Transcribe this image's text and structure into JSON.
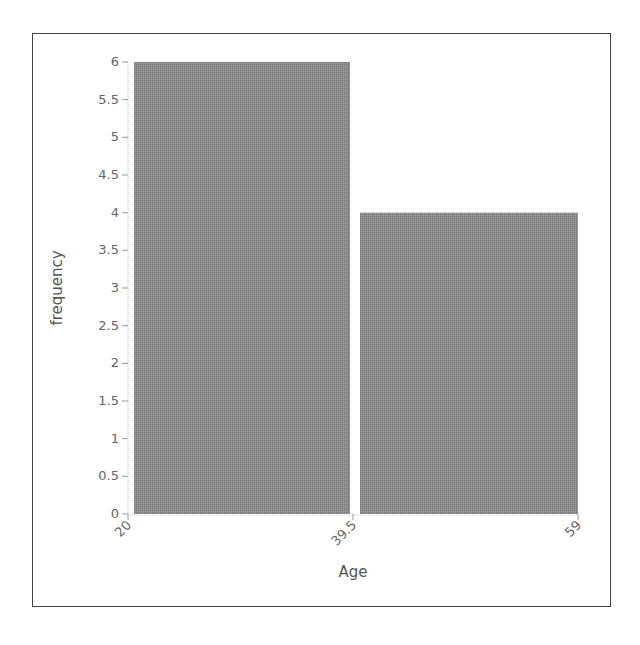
{
  "chart_data": {
    "type": "bar",
    "subtype": "histogram",
    "title": "",
    "xlabel": "Age",
    "ylabel": "frequency",
    "bins": [
      {
        "start": 20,
        "end": 39.5,
        "value": 6
      },
      {
        "start": 39.5,
        "end": 59,
        "value": 4
      }
    ],
    "categories": [
      "20–39.5",
      "39.5–59"
    ],
    "values": [
      6,
      4
    ],
    "x_ticks": [
      "20",
      "39.5",
      "59"
    ],
    "y_ticks": [
      "0",
      "0.5",
      "1",
      "1.5",
      "2",
      "2.5",
      "3",
      "3.5",
      "4",
      "4.5",
      "5",
      "5.5",
      "6"
    ],
    "xlim": [
      20,
      59
    ],
    "ylim": [
      0,
      6
    ],
    "grid": false,
    "legend": null,
    "bar_color": "#8c8c8c"
  }
}
